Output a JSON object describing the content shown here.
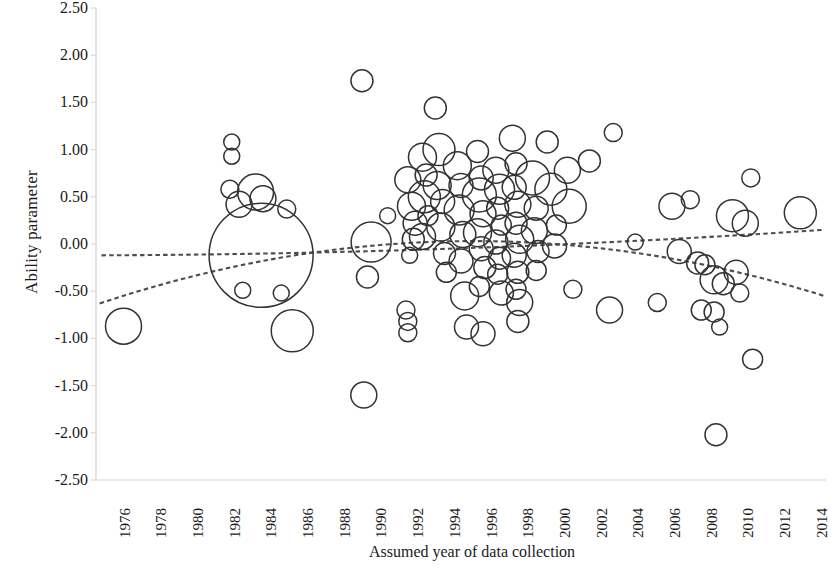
{
  "chart_data": {
    "type": "scatter",
    "subtype": "bubble",
    "title": "",
    "xlabel": "Assumed year of data collection",
    "ylabel": "Ability parameter",
    "xlim": [
      1975.2,
      2015.0
    ],
    "ylim": [
      -2.5,
      2.5
    ],
    "ytick_labels": [
      "2.50",
      "2.00",
      "1.50",
      "1.00",
      "0.50",
      "0.00",
      "-0.50",
      "-1.00",
      "-1.50",
      "-2.00",
      "-2.50"
    ],
    "ytick_values": [
      2.5,
      2.0,
      1.5,
      1.0,
      0.5,
      0.0,
      -0.5,
      -1.0,
      -1.5,
      -2.0,
      -2.5
    ],
    "xtick_labels": [
      "1976",
      "1978",
      "1980",
      "1982",
      "1984",
      "1986",
      "1988",
      "1990",
      "1992",
      "1994",
      "1996",
      "1998",
      "2000",
      "2002",
      "2004",
      "2006",
      "2008",
      "2010",
      "2012",
      "2014"
    ],
    "xtick_values": [
      1976,
      1978,
      1980,
      1982,
      1984,
      1986,
      1988,
      1990,
      1992,
      1994,
      1996,
      1998,
      2000,
      2002,
      2004,
      2006,
      2008,
      2010,
      2012,
      2014
    ],
    "grid": false,
    "legend": null,
    "marker_style": "open-circle",
    "marker_color": "#333333",
    "marker_fill": "none",
    "axis_color": "#d8d8d8",
    "points": [
      {
        "x": 1976.7,
        "y": -0.87,
        "size": 18
      },
      {
        "x": 1982.6,
        "y": 1.08,
        "size": 8
      },
      {
        "x": 1982.6,
        "y": 0.93,
        "size": 8
      },
      {
        "x": 1982.5,
        "y": 0.58,
        "size": 9
      },
      {
        "x": 1983.0,
        "y": 0.42,
        "size": 13
      },
      {
        "x": 1983.9,
        "y": 0.55,
        "size": 18
      },
      {
        "x": 1984.3,
        "y": 0.48,
        "size": 13
      },
      {
        "x": 1985.6,
        "y": 0.37,
        "size": 9
      },
      {
        "x": 1984.2,
        "y": -0.12,
        "size": 52
      },
      {
        "x": 1983.2,
        "y": -0.49,
        "size": 8
      },
      {
        "x": 1985.3,
        "y": -0.52,
        "size": 8
      },
      {
        "x": 1985.9,
        "y": -0.92,
        "size": 21
      },
      {
        "x": 1989.7,
        "y": 1.73,
        "size": 11
      },
      {
        "x": 1989.8,
        "y": -1.6,
        "size": 13
      },
      {
        "x": 1990.2,
        "y": 0.02,
        "size": 20
      },
      {
        "x": 1990.0,
        "y": -0.35,
        "size": 11
      },
      {
        "x": 1992.2,
        "y": 0.68,
        "size": 13
      },
      {
        "x": 1992.4,
        "y": 0.4,
        "size": 14
      },
      {
        "x": 1992.6,
        "y": 0.22,
        "size": 12
      },
      {
        "x": 1992.5,
        "y": 0.05,
        "size": 11
      },
      {
        "x": 1992.3,
        "y": -0.12,
        "size": 8
      },
      {
        "x": 1992.1,
        "y": -0.7,
        "size": 9
      },
      {
        "x": 1992.2,
        "y": -0.82,
        "size": 9
      },
      {
        "x": 1992.2,
        "y": -0.94,
        "size": 9
      },
      {
        "x": 1993.0,
        "y": 0.92,
        "size": 14
      },
      {
        "x": 1993.2,
        "y": 0.73,
        "size": 11
      },
      {
        "x": 1993.1,
        "y": 0.5,
        "size": 16
      },
      {
        "x": 1993.3,
        "y": 0.3,
        "size": 10
      },
      {
        "x": 1993.0,
        "y": 0.08,
        "size": 13
      },
      {
        "x": 1993.7,
        "y": 1.44,
        "size": 11
      },
      {
        "x": 1993.9,
        "y": 1.0,
        "size": 16
      },
      {
        "x": 1993.8,
        "y": 0.62,
        "size": 14
      },
      {
        "x": 1994.1,
        "y": 0.45,
        "size": 12
      },
      {
        "x": 1994.0,
        "y": 0.18,
        "size": 14
      },
      {
        "x": 1994.2,
        "y": -0.1,
        "size": 11
      },
      {
        "x": 1994.3,
        "y": -0.3,
        "size": 10
      },
      {
        "x": 1994.9,
        "y": 0.83,
        "size": 14
      },
      {
        "x": 1995.1,
        "y": 0.62,
        "size": 12
      },
      {
        "x": 1995.0,
        "y": 0.36,
        "size": 15
      },
      {
        "x": 1995.2,
        "y": 0.1,
        "size": 13
      },
      {
        "x": 1995.1,
        "y": -0.18,
        "size": 12
      },
      {
        "x": 1995.3,
        "y": -0.55,
        "size": 14
      },
      {
        "x": 1995.4,
        "y": -0.88,
        "size": 12
      },
      {
        "x": 1996.0,
        "y": 0.98,
        "size": 11
      },
      {
        "x": 1996.2,
        "y": 0.7,
        "size": 12
      },
      {
        "x": 1996.1,
        "y": 0.52,
        "size": 17
      },
      {
        "x": 1996.3,
        "y": 0.32,
        "size": 13
      },
      {
        "x": 1996.0,
        "y": 0.12,
        "size": 14
      },
      {
        "x": 1996.2,
        "y": -0.05,
        "size": 12
      },
      {
        "x": 1996.4,
        "y": -0.25,
        "size": 11
      },
      {
        "x": 1996.1,
        "y": -0.45,
        "size": 10
      },
      {
        "x": 1996.3,
        "y": -0.95,
        "size": 12
      },
      {
        "x": 1997.0,
        "y": 0.78,
        "size": 13
      },
      {
        "x": 1997.2,
        "y": 0.58,
        "size": 15
      },
      {
        "x": 1997.1,
        "y": 0.38,
        "size": 11
      },
      {
        "x": 1997.3,
        "y": 0.2,
        "size": 10
      },
      {
        "x": 1997.0,
        "y": 0.02,
        "size": 12
      },
      {
        "x": 1997.2,
        "y": -0.15,
        "size": 11
      },
      {
        "x": 1997.1,
        "y": -0.32,
        "size": 10
      },
      {
        "x": 1997.3,
        "y": -0.52,
        "size": 12
      },
      {
        "x": 1997.9,
        "y": 1.12,
        "size": 13
      },
      {
        "x": 1998.1,
        "y": 0.85,
        "size": 11
      },
      {
        "x": 1998.0,
        "y": 0.6,
        "size": 12
      },
      {
        "x": 1998.2,
        "y": 0.42,
        "size": 13
      },
      {
        "x": 1998.1,
        "y": 0.22,
        "size": 11
      },
      {
        "x": 1998.3,
        "y": 0.05,
        "size": 14
      },
      {
        "x": 1998.0,
        "y": -0.12,
        "size": 12
      },
      {
        "x": 1998.2,
        "y": -0.3,
        "size": 11
      },
      {
        "x": 1998.1,
        "y": -0.48,
        "size": 10
      },
      {
        "x": 1998.3,
        "y": -0.62,
        "size": 13
      },
      {
        "x": 1998.2,
        "y": -0.82,
        "size": 11
      },
      {
        "x": 1999.0,
        "y": 0.7,
        "size": 17
      },
      {
        "x": 1999.2,
        "y": 0.38,
        "size": 12
      },
      {
        "x": 1999.1,
        "y": 0.14,
        "size": 13
      },
      {
        "x": 1999.3,
        "y": -0.08,
        "size": 11
      },
      {
        "x": 1999.2,
        "y": -0.28,
        "size": 10
      },
      {
        "x": 2000.0,
        "y": 0.58,
        "size": 16
      },
      {
        "x": 2000.3,
        "y": 0.2,
        "size": 10
      },
      {
        "x": 2000.2,
        "y": -0.02,
        "size": 12
      },
      {
        "x": 2000.9,
        "y": 0.78,
        "size": 13
      },
      {
        "x": 2001.0,
        "y": 0.4,
        "size": 17
      },
      {
        "x": 2001.2,
        "y": -0.48,
        "size": 9
      },
      {
        "x": 2002.1,
        "y": 0.88,
        "size": 11
      },
      {
        "x": 2003.4,
        "y": 1.18,
        "size": 9
      },
      {
        "x": 2003.2,
        "y": -0.7,
        "size": 13
      },
      {
        "x": 2006.6,
        "y": 0.4,
        "size": 13
      },
      {
        "x": 2007.6,
        "y": 0.47,
        "size": 9
      },
      {
        "x": 2007.0,
        "y": -0.08,
        "size": 12
      },
      {
        "x": 2008.0,
        "y": -0.2,
        "size": 11
      },
      {
        "x": 2008.4,
        "y": -0.22,
        "size": 10
      },
      {
        "x": 2008.9,
        "y": -0.38,
        "size": 14
      },
      {
        "x": 2009.4,
        "y": -0.42,
        "size": 11
      },
      {
        "x": 2008.2,
        "y": -0.7,
        "size": 10
      },
      {
        "x": 2008.9,
        "y": -0.72,
        "size": 10
      },
      {
        "x": 2009.2,
        "y": -0.88,
        "size": 8
      },
      {
        "x": 2009.0,
        "y": -2.02,
        "size": 11
      },
      {
        "x": 2009.9,
        "y": 0.3,
        "size": 16
      },
      {
        "x": 2010.1,
        "y": -0.3,
        "size": 12
      },
      {
        "x": 2010.3,
        "y": -0.52,
        "size": 9
      },
      {
        "x": 2010.9,
        "y": 0.7,
        "size": 9
      },
      {
        "x": 2010.6,
        "y": 0.22,
        "size": 13
      },
      {
        "x": 2011.0,
        "y": -1.22,
        "size": 10
      },
      {
        "x": 2013.6,
        "y": 0.33,
        "size": 16
      },
      {
        "x": 1991.1,
        "y": 0.3,
        "size": 8
      },
      {
        "x": 2005.8,
        "y": -0.62,
        "size": 9
      },
      {
        "x": 1999.8,
        "y": 1.08,
        "size": 11
      },
      {
        "x": 2004.6,
        "y": 0.02,
        "size": 8
      }
    ],
    "trendlines": [
      {
        "name": "linear-flat",
        "style": "dashed",
        "color": "#4d4d4d",
        "type": "quadratic",
        "endpoints": {
          "x0": 1975.5,
          "y0": -0.12,
          "x1": 2014.9,
          "y1": 0.15
        },
        "curvature": -0.06
      },
      {
        "name": "rising-then-falling",
        "style": "dashed",
        "color": "#4d4d4d",
        "type": "quadratic",
        "endpoints": {
          "x0": 1975.4,
          "y0": -0.63,
          "x1": 2014.9,
          "y1": -0.55
        },
        "curvature": 0.62
      }
    ]
  }
}
